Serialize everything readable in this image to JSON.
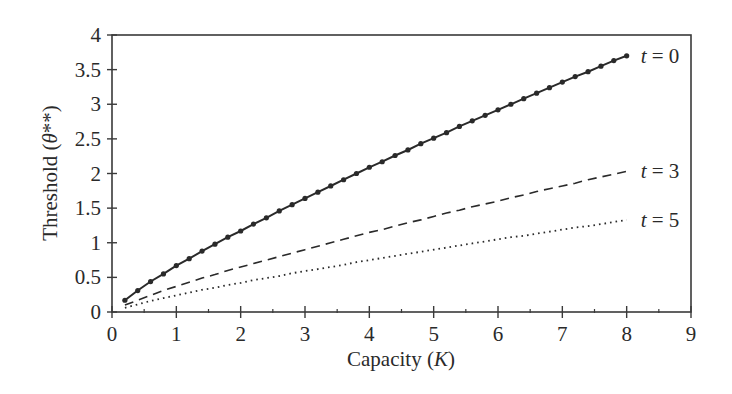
{
  "chart_data": {
    "type": "line",
    "title": "",
    "xlabel": "Capacity (K)",
    "xlabel_parts": {
      "pre": "Capacity (",
      "var": "K",
      "post": ")"
    },
    "ylabel": "Threshold (θ**)",
    "ylabel_parts": {
      "pre": "Threshold (",
      "var": "θ",
      "post": "**)"
    },
    "xlim": [
      0,
      9
    ],
    "ylim": [
      0,
      4
    ],
    "xticks": [
      "0",
      "1",
      "2",
      "3",
      "4",
      "5",
      "6",
      "7",
      "8",
      "9"
    ],
    "yticks": [
      "0",
      "0.5",
      "1",
      "1.5",
      "2",
      "2.5",
      "3",
      "3.5",
      "4"
    ],
    "grid": false,
    "legend_position": "inline-right",
    "x": [
      0.2,
      0.4,
      0.6,
      0.8,
      1.0,
      1.2,
      1.4,
      1.6,
      1.8,
      2.0,
      2.2,
      2.4,
      2.6,
      2.8,
      3.0,
      3.2,
      3.4,
      3.6,
      3.8,
      4.0,
      4.2,
      4.4,
      4.6,
      4.8,
      5.0,
      5.2,
      5.4,
      5.6,
      5.8,
      6.0,
      6.2,
      6.4,
      6.6,
      6.8,
      7.0,
      7.2,
      7.4,
      7.6,
      7.8,
      8.0
    ],
    "series": [
      {
        "name": "t = 0",
        "style": "solid-with-markers",
        "values": [
          0.17,
          0.31,
          0.44,
          0.55,
          0.67,
          0.77,
          0.88,
          0.98,
          1.08,
          1.17,
          1.27,
          1.36,
          1.46,
          1.55,
          1.64,
          1.73,
          1.82,
          1.91,
          2.0,
          2.09,
          2.17,
          2.26,
          2.34,
          2.43,
          2.51,
          2.59,
          2.68,
          2.76,
          2.84,
          2.92,
          3.0,
          3.08,
          3.16,
          3.24,
          3.32,
          3.4,
          3.47,
          3.55,
          3.63,
          3.7
        ]
      },
      {
        "name": "t = 3",
        "style": "dashed",
        "values": [
          0.1,
          0.17,
          0.24,
          0.31,
          0.37,
          0.43,
          0.49,
          0.54,
          0.6,
          0.65,
          0.7,
          0.75,
          0.8,
          0.85,
          0.9,
          0.95,
          1.0,
          1.05,
          1.1,
          1.15,
          1.19,
          1.24,
          1.29,
          1.33,
          1.38,
          1.43,
          1.47,
          1.52,
          1.56,
          1.6,
          1.65,
          1.69,
          1.74,
          1.78,
          1.82,
          1.86,
          1.91,
          1.95,
          1.99,
          2.03
        ]
      },
      {
        "name": "t = 5",
        "style": "dotted",
        "values": [
          0.06,
          0.11,
          0.16,
          0.2,
          0.24,
          0.28,
          0.32,
          0.35,
          0.39,
          0.42,
          0.46,
          0.49,
          0.52,
          0.56,
          0.59,
          0.62,
          0.65,
          0.68,
          0.72,
          0.75,
          0.78,
          0.81,
          0.84,
          0.87,
          0.9,
          0.93,
          0.96,
          0.99,
          1.02,
          1.05,
          1.08,
          1.1,
          1.13,
          1.16,
          1.19,
          1.22,
          1.24,
          1.27,
          1.3,
          1.33
        ]
      }
    ],
    "annotations": [
      {
        "text": "t = 0",
        "var": "t",
        "rhs": "= 0",
        "near_series": "t = 0"
      },
      {
        "text": "t = 3",
        "var": "t",
        "rhs": "= 3",
        "near_series": "t = 3"
      },
      {
        "text": "t = 5",
        "var": "t",
        "rhs": "= 5",
        "near_series": "t = 5"
      }
    ],
    "colors": {
      "axis": "#3a3a3a",
      "line": "#2a2a2a"
    }
  }
}
